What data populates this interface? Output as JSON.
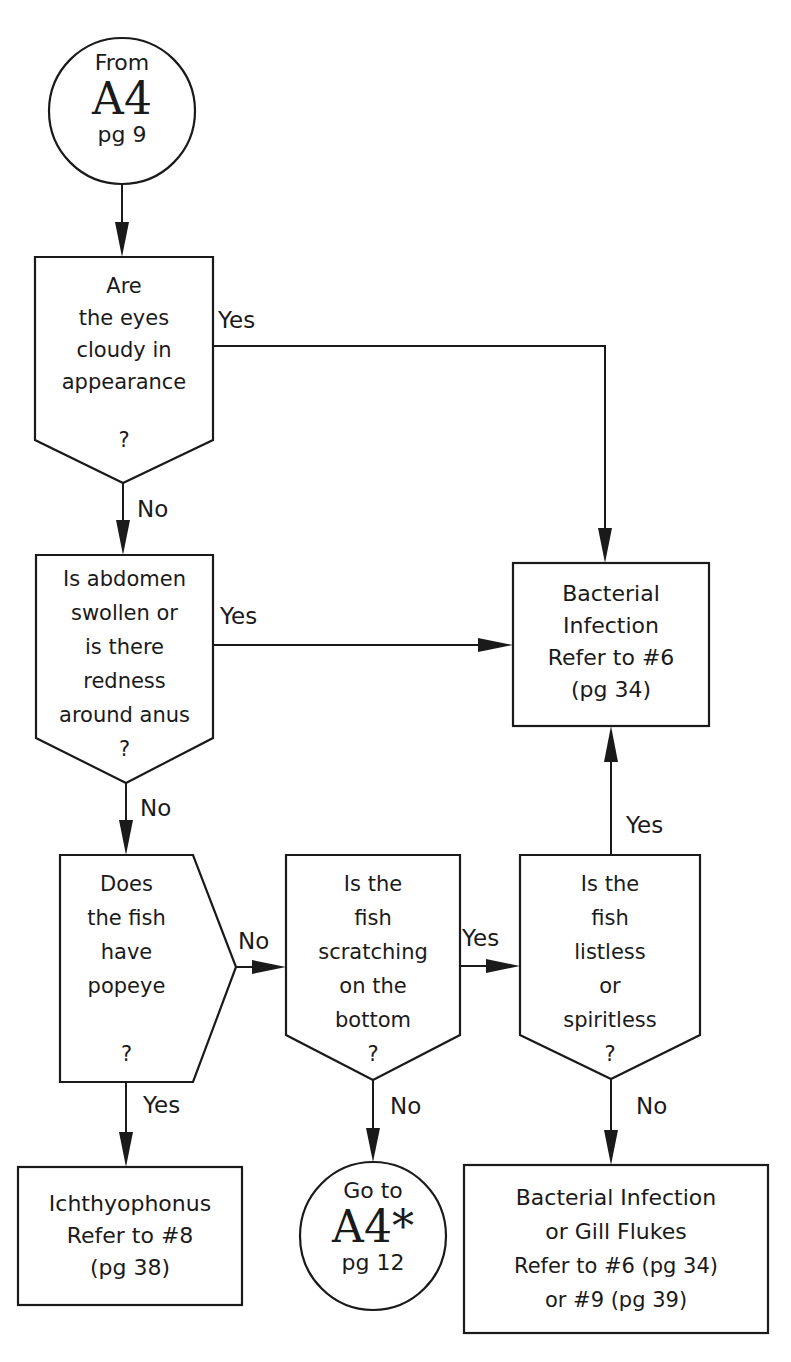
{
  "flowchart": {
    "start": {
      "line1": "From",
      "line2": "A4",
      "line3": "pg 9"
    },
    "q_eyes": {
      "lines": [
        "Are",
        "the eyes",
        "cloudy in",
        "appearance"
      ],
      "mark": "?"
    },
    "q_abdomen": {
      "lines": [
        "Is abdomen",
        "swollen or",
        "is there",
        "redness",
        "around anus"
      ],
      "mark": "?"
    },
    "q_popeye": {
      "lines": [
        "Does",
        "the fish",
        "have",
        "popeye"
      ],
      "mark": "?"
    },
    "q_scratching": {
      "lines": [
        "Is the",
        "fish",
        "scratching",
        "on the",
        "bottom"
      ],
      "mark": "?"
    },
    "q_listless": {
      "lines": [
        "Is the",
        "fish",
        "listless",
        "or",
        "spiritless"
      ],
      "mark": "?"
    },
    "r_bacterial": {
      "lines": [
        "Bacterial",
        "Infection",
        "Refer to #6",
        "(pg 34)"
      ]
    },
    "r_ichthyophonus": {
      "lines": [
        "Ichthyophonus",
        "Refer to #8",
        "(pg 38)"
      ]
    },
    "goto": {
      "line1": "Go to",
      "line2": "A4*",
      "line3": "pg 12"
    },
    "r_gill": {
      "lines": [
        "Bacterial Infection",
        "or Gill Flukes",
        "Refer to #6 (pg 34)",
        "or #9 (pg 39)"
      ]
    },
    "edges": {
      "eyes_yes": "Yes",
      "eyes_no": "No",
      "abdomen_yes": "Yes",
      "abdomen_no": "No",
      "popeye_no": "No",
      "popeye_yes": "Yes",
      "scratching_yes": "Yes",
      "scratching_no": "No",
      "listless_yes": "Yes",
      "listless_no": "No"
    }
  }
}
